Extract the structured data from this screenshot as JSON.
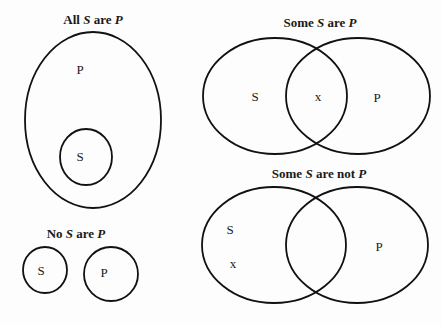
{
  "diagrams": {
    "all_s_are_p": {
      "title": {
        "pre": "All ",
        "s": "S",
        "mid": " are ",
        "p": "P"
      },
      "outer_label": "P",
      "inner_label": "S"
    },
    "some_s_are_p": {
      "title": {
        "pre": "Some ",
        "s": "S",
        "mid": " are ",
        "p": "P"
      },
      "left_label": "S",
      "overlap_mark": "x",
      "right_label": "P"
    },
    "some_s_are_not_p": {
      "title": {
        "pre": "Some ",
        "s": "S",
        "mid": " are not ",
        "p": "P"
      },
      "left_label": "S",
      "left_mark": "x",
      "right_label": "P"
    },
    "no_s_are_p": {
      "title": {
        "pre": "No ",
        "s": "S",
        "mid": " are ",
        "p": "P"
      },
      "left_label": "S",
      "right_label": "P"
    }
  }
}
